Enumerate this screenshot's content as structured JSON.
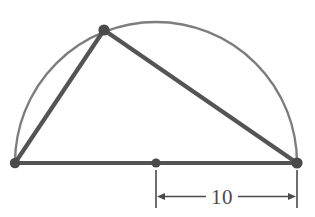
{
  "figure": {
    "background_color": "#ffffff"
  },
  "colors": {
    "arc_stroke": "#7d7d7d",
    "triangle_stroke": "#545454",
    "vertex_fill": "#4a4a4a",
    "dimension_stroke": "#4a4a4a",
    "label_text": "#4a4a4a"
  },
  "geometry": {
    "arc": {
      "name": "semicircle",
      "center": {
        "x": 156,
        "y": 163
      },
      "radius": 141,
      "start": {
        "x": 15,
        "y": 163
      },
      "end": {
        "x": 297,
        "y": 163
      },
      "stroke_width": 2.4
    },
    "vertices": [
      {
        "id": "A",
        "role": "diameter-left-endpoint",
        "x": 15,
        "y": 163,
        "radius": 5.2
      },
      {
        "id": "B",
        "role": "apex-on-arc",
        "x": 104,
        "y": 30,
        "radius": 5.6
      },
      {
        "id": "C",
        "role": "diameter-right-endpoint",
        "x": 297,
        "y": 163,
        "radius": 5.6
      },
      {
        "id": "O",
        "role": "center-midpoint",
        "x": 156,
        "y": 163,
        "radius": 4.6
      }
    ],
    "edges": [
      {
        "id": "AB",
        "name": "left-leg",
        "from": "A",
        "to": "B",
        "stroke_width": 4.2
      },
      {
        "id": "BC",
        "name": "hypotenuse",
        "from": "B",
        "to": "C",
        "stroke_width": 4.2
      },
      {
        "id": "AC",
        "name": "base-diameter",
        "from": "A",
        "to": "C",
        "stroke_width": 4.2
      }
    ]
  },
  "dimension": {
    "label": "10",
    "measures": "center-to-right-endpoint (radius)",
    "line_y": 196.5,
    "left_x": 156,
    "right_x": 297,
    "extension_top_y": 170,
    "extension_bottom_y": 208,
    "label_x": 222,
    "label_y": 204,
    "stroke_width": 1.6,
    "arrow_size": 8
  }
}
